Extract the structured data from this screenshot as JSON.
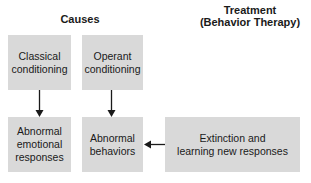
{
  "headings": {
    "causes": "Causes",
    "treatment_line1": "Treatment",
    "treatment_line2": "(Behavior Therapy)"
  },
  "boxes": {
    "classical": [
      "Classical",
      "conditioning"
    ],
    "operant": [
      "Operant",
      "conditioning"
    ],
    "emotional": [
      "Abnormal",
      "emotional",
      "responses"
    ],
    "behaviors": [
      "Abnormal",
      "behaviors"
    ],
    "extinction": [
      "Extinction and",
      "learning new responses"
    ]
  },
  "colors": {
    "box_fill": "#d9d9d9",
    "arrow": "#1a1a1a"
  },
  "edges": [
    {
      "from": "classical",
      "to": "emotional"
    },
    {
      "from": "operant",
      "to": "behaviors"
    },
    {
      "from": "extinction",
      "to": "behaviors"
    }
  ]
}
